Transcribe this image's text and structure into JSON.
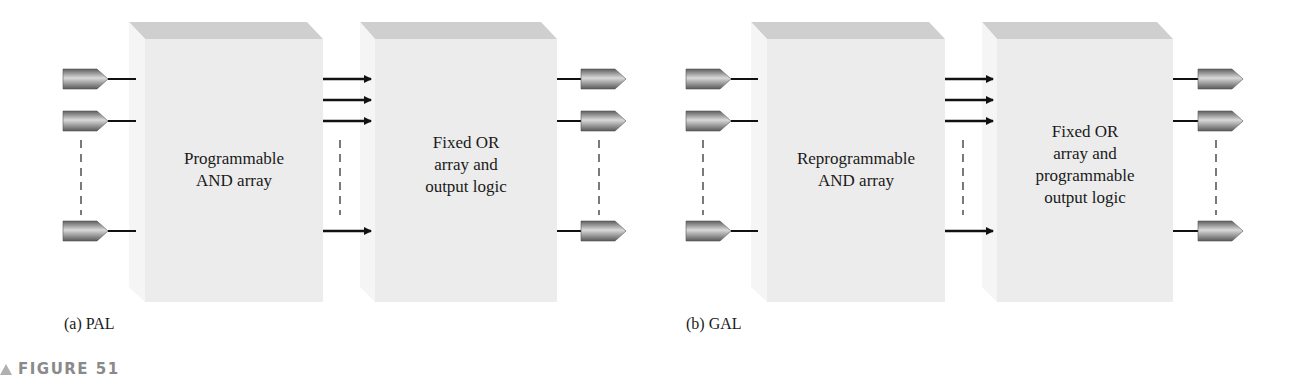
{
  "figure": {
    "caption": "FIGURE 51",
    "colors": {
      "block_face": "#ececec",
      "block_top": "#cfcfcf",
      "block_side": "#f4f4f4",
      "pin_dark": "#6e6e6e",
      "pin_light": "#d6d6d6",
      "wire": "#111111",
      "caption_gray": "#8a8a8a"
    },
    "panels": [
      {
        "id": "pal",
        "sub_caption": "(a) PAL",
        "blocks": [
          {
            "name": "and-array-block",
            "label": "Programmable\nAND array"
          },
          {
            "name": "or-array-block",
            "label": "Fixed OR\narray and\noutput logic"
          }
        ],
        "inputs": 3,
        "interconnects": 4,
        "outputs": 3
      },
      {
        "id": "gal",
        "sub_caption": "(b) GAL",
        "blocks": [
          {
            "name": "and-array-block",
            "label": "Reprogrammable\nAND array"
          },
          {
            "name": "or-array-block",
            "label": "Fixed OR\narray and\nprogrammable\noutput logic"
          }
        ],
        "inputs": 3,
        "interconnects": 4,
        "outputs": 3
      }
    ]
  }
}
